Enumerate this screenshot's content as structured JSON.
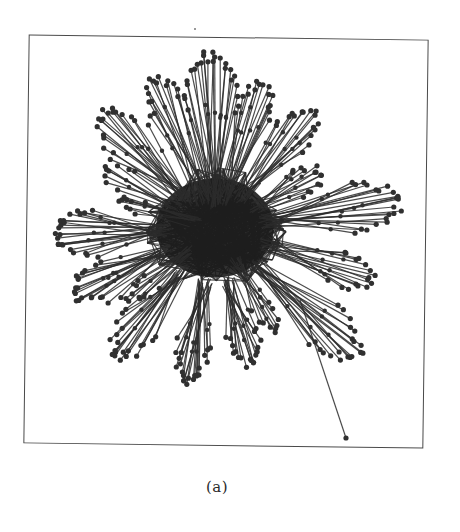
{
  "figure": {
    "caption": "(a)",
    "type": "network-graph",
    "frame": {
      "left": 26,
      "top": 37,
      "width": 400,
      "height": 409
    },
    "colors": {
      "edge": "#2b2b2b",
      "node": "#303030",
      "frame": "#4a4a4a",
      "background": "#ffffff"
    },
    "center": {
      "x": 215,
      "y": 228
    },
    "core": {
      "radius": 62,
      "nodes": 140,
      "edges": 520
    },
    "fans": [
      {
        "angle": -92,
        "hub_r": 25,
        "tip_r": 172,
        "count": 22,
        "spread": 22
      },
      {
        "angle": -72,
        "hub_r": 30,
        "tip_r": 150,
        "count": 16,
        "spread": 18
      },
      {
        "angle": -112,
        "hub_r": 30,
        "tip_r": 160,
        "count": 16,
        "spread": 16
      },
      {
        "angle": -50,
        "hub_r": 40,
        "tip_r": 150,
        "count": 16,
        "spread": 20
      },
      {
        "angle": -135,
        "hub_r": 40,
        "tip_r": 160,
        "count": 18,
        "spread": 22
      },
      {
        "angle": -152,
        "hub_r": 45,
        "tip_r": 125,
        "count": 10,
        "spread": 16
      },
      {
        "angle": -28,
        "hub_r": 45,
        "tip_r": 120,
        "count": 14,
        "spread": 18
      },
      {
        "angle": -8,
        "hub_r": 50,
        "tip_r": 185,
        "count": 22,
        "spread": 20
      },
      {
        "angle": 178,
        "hub_r": 50,
        "tip_r": 160,
        "count": 22,
        "spread": 22
      },
      {
        "angle": 18,
        "hub_r": 55,
        "tip_r": 165,
        "count": 16,
        "spread": 16
      },
      {
        "angle": 155,
        "hub_r": 55,
        "tip_r": 155,
        "count": 20,
        "spread": 20
      },
      {
        "angle": 42,
        "hub_r": 55,
        "tip_r": 190,
        "count": 20,
        "spread": 18
      },
      {
        "angle": 128,
        "hub_r": 55,
        "tip_r": 160,
        "count": 20,
        "spread": 18
      },
      {
        "angle": 100,
        "hub_r": 55,
        "tip_r": 155,
        "count": 22,
        "spread": 16
      },
      {
        "angle": 75,
        "hub_r": 55,
        "tip_r": 140,
        "count": 18,
        "spread": 16
      },
      {
        "angle": 60,
        "hub_r": 40,
        "tip_r": 120,
        "count": 10,
        "spread": 12
      },
      {
        "angle": 140,
        "hub_r": 30,
        "tip_r": 110,
        "count": 10,
        "spread": 12
      },
      {
        "angle": -165,
        "hub_r": 20,
        "tip_r": 100,
        "count": 8,
        "spread": 10
      }
    ],
    "outlier": {
      "from": {
        "x": 300,
        "y": 300
      },
      "to": {
        "x": 346,
        "y": 438
      }
    },
    "seed": 1337
  }
}
